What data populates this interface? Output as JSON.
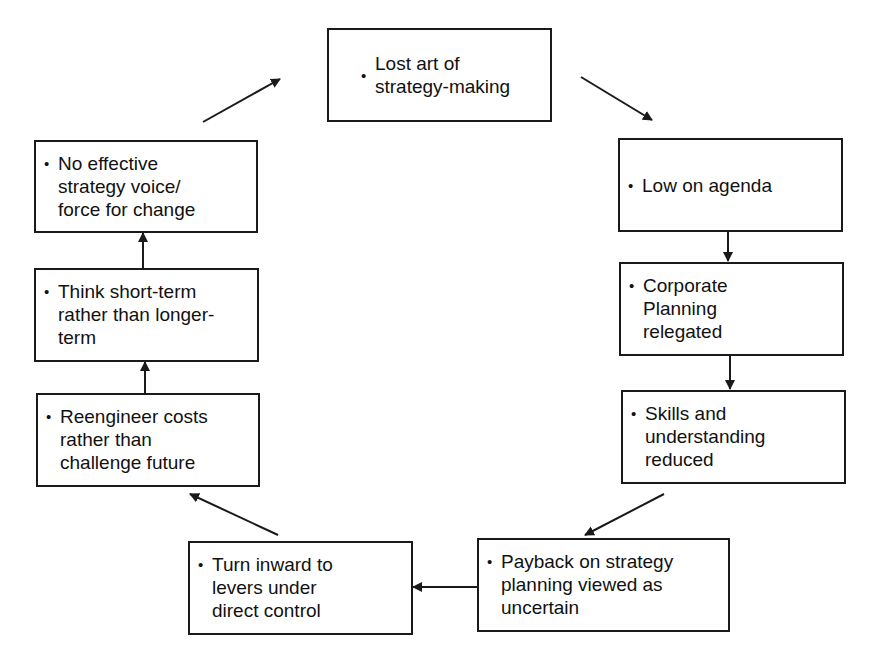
{
  "diagram": {
    "type": "cycle",
    "bullet_glyph": "•",
    "colors": {
      "stroke": "#1a1a1a",
      "background": "#ffffff",
      "text": "#111111"
    },
    "nodes": [
      {
        "id": "lost-art",
        "text": "Lost art of\nstrategy-making"
      },
      {
        "id": "low-agenda",
        "text": "Low on agenda"
      },
      {
        "id": "corporate-planning",
        "text": "Corporate\nPlanning\nrelegated"
      },
      {
        "id": "skills-reduced",
        "text": "Skills and\nunderstanding\nreduced"
      },
      {
        "id": "payback-uncertain",
        "text": "Payback on strategy\nplanning viewed as\nuncertain"
      },
      {
        "id": "turn-inward",
        "text": "Turn inward to\nlevers under\ndirect control"
      },
      {
        "id": "reengineer-costs",
        "text": "Reengineer costs\nrather than\nchallenge future"
      },
      {
        "id": "short-term",
        "text": "Think short-term\nrather than longer-\nterm"
      },
      {
        "id": "no-voice",
        "text": "No effective\nstrategy voice/\nforce for change"
      }
    ],
    "edges": [
      {
        "from": "lost-art",
        "to": "low-agenda"
      },
      {
        "from": "low-agenda",
        "to": "corporate-planning"
      },
      {
        "from": "corporate-planning",
        "to": "skills-reduced"
      },
      {
        "from": "skills-reduced",
        "to": "payback-uncertain"
      },
      {
        "from": "payback-uncertain",
        "to": "turn-inward"
      },
      {
        "from": "turn-inward",
        "to": "reengineer-costs"
      },
      {
        "from": "reengineer-costs",
        "to": "short-term"
      },
      {
        "from": "short-term",
        "to": "no-voice"
      },
      {
        "from": "no-voice",
        "to": "lost-art"
      }
    ]
  }
}
